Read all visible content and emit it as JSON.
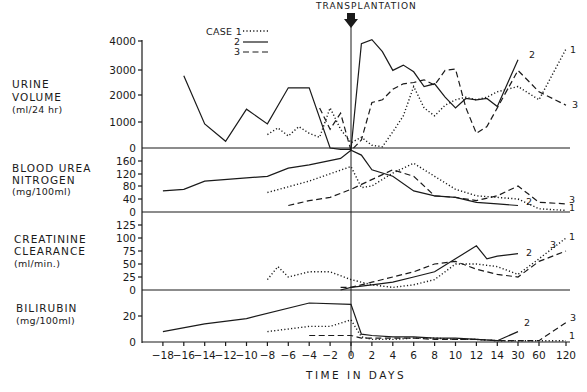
{
  "chart_data": {
    "type": "line",
    "title": "",
    "annotation": "TRANSPLANTATION",
    "xlabel": "TIME IN DAYS",
    "x_ticks": [
      "-18",
      "-16",
      "-14",
      "-12",
      "-10",
      "-8",
      "-6",
      "-4",
      "-2",
      "0",
      "2",
      "4",
      "6",
      "8",
      "10",
      "12",
      "14",
      "30",
      "60",
      "120"
    ],
    "legend": {
      "title": "CASE",
      "entries": [
        {
          "label": "1",
          "style": "dotted"
        },
        {
          "label": "2",
          "style": "solid"
        },
        {
          "label": "3",
          "style": "dashed"
        }
      ],
      "position": "top-center"
    },
    "panels": [
      {
        "name": "urine-volume",
        "ylabel": [
          "URINE",
          "VOLUME",
          "(ml/24 hr)"
        ],
        "y_ticks": [
          "0",
          "1000",
          "2000",
          "3000",
          "4000"
        ],
        "ylim": [
          0,
          4000
        ],
        "series": [
          {
            "name": "1",
            "x": [
              "-8",
              "-7",
              "-6",
              "-5",
              "-4",
              "-3",
              "-2",
              "-1",
              "0",
              "1",
              "2",
              "3",
              "4",
              "5",
              "6",
              "7",
              "8",
              "9",
              "10",
              "11",
              "12",
              "13",
              "14",
              "30",
              "60",
              "120"
            ],
            "values": [
              500,
              750,
              450,
              800,
              550,
              400,
              1500,
              700,
              200,
              400,
              100,
              50,
              600,
              1200,
              2300,
              1500,
              1200,
              1600,
              1800,
              1900,
              1800,
              1900,
              2100,
              2300,
              1800,
              3700
            ]
          },
          {
            "name": "2",
            "x": [
              "-16",
              "-14",
              "-12",
              "-10",
              "-8",
              "-6",
              "-4",
              "-2",
              "-1",
              "0",
              "1",
              "2",
              "3",
              "4",
              "5",
              "6",
              "7",
              "8",
              "9",
              "10",
              "11",
              "12",
              "13",
              "14",
              "30"
            ],
            "values": [
              2700,
              900,
              250,
              1450,
              900,
              2250,
              2250,
              0,
              -50,
              -50,
              3900,
              4050,
              3600,
              2900,
              3100,
              2850,
              2300,
              2400,
              1900,
              1500,
              1850,
              1800,
              1850,
              1550,
              3300
            ]
          },
          {
            "name": "3",
            "x": [
              "-3",
              "-2",
              "-1",
              "0",
              "1",
              "2",
              "3",
              "4",
              "5",
              "6",
              "7",
              "8",
              "9",
              "10",
              "11",
              "12",
              "13",
              "14",
              "30",
              "60",
              "120"
            ],
            "values": [
              1500,
              700,
              1300,
              -100,
              300,
              1700,
              1800,
              2200,
              2400,
              2450,
              2550,
              2350,
              2900,
              2950,
              1500,
              550,
              800,
              1500,
              2900,
              2100,
              1600
            ]
          }
        ]
      },
      {
        "name": "blood-urea-nitrogen",
        "ylabel": [
          "BLOOD UREA",
          "NITROGEN",
          "(mg/100ml)"
        ],
        "y_ticks": [
          "0",
          "40",
          "80",
          "120",
          "160"
        ],
        "ylim": [
          0,
          160
        ],
        "series": [
          {
            "name": "1",
            "x": [
              "-8",
              "-4",
              "0",
              "1",
              "2",
              "4",
              "6",
              "8",
              "10",
              "12",
              "14",
              "30",
              "60",
              "120"
            ],
            "values": [
              60,
              95,
              140,
              75,
              80,
              120,
              150,
              110,
              70,
              50,
              45,
              40,
              10,
              5
            ]
          },
          {
            "name": "2",
            "x": [
              "-18",
              "-16",
              "-14",
              "-10",
              "-8",
              "-6",
              "-4",
              "-1",
              "0",
              "1",
              "2",
              "4",
              "6",
              "8",
              "10",
              "12",
              "14",
              "30"
            ],
            "values": [
              65,
              70,
              95,
              105,
              110,
              135,
              145,
              165,
              190,
              175,
              130,
              110,
              65,
              50,
              45,
              30,
              25,
              20
            ]
          },
          {
            "name": "3",
            "x": [
              "-6",
              "-4",
              "-2",
              "0",
              "4",
              "6",
              "8",
              "10",
              "12",
              "14",
              "30",
              "60",
              "120"
            ],
            "values": [
              20,
              35,
              45,
              70,
              130,
              110,
              50,
              45,
              35,
              50,
              80,
              30,
              25
            ]
          }
        ]
      },
      {
        "name": "creatinine-clearance",
        "ylabel": [
          "CREATININE",
          "CLEARANCE",
          "(ml/min.)"
        ],
        "y_ticks": [
          "0",
          "25",
          "50",
          "75",
          "100",
          "125"
        ],
        "ylim": [
          0,
          125
        ],
        "series": [
          {
            "name": "1",
            "x": [
              "-8",
              "-7",
              "-6",
              "-4",
              "-2",
              "0",
              "2",
              "4",
              "6",
              "8",
              "10",
              "12",
              "14",
              "30",
              "60",
              "120"
            ],
            "values": [
              20,
              45,
              25,
              35,
              35,
              20,
              10,
              5,
              10,
              20,
              50,
              50,
              45,
              30,
              60,
              100
            ]
          },
          {
            "name": "2",
            "x": [
              "-1",
              "0",
              "2",
              "4",
              "6",
              "8",
              "10",
              "12",
              "13",
              "14",
              "30"
            ],
            "values": [
              0,
              5,
              10,
              15,
              25,
              35,
              60,
              85,
              60,
              65,
              70
            ]
          },
          {
            "name": "3",
            "x": [
              "-1",
              "0",
              "2",
              "4",
              "6",
              "8",
              "10",
              "12",
              "14",
              "30",
              "60",
              "120"
            ],
            "values": [
              5,
              5,
              15,
              25,
              35,
              50,
              55,
              40,
              30,
              25,
              55,
              75
            ]
          }
        ]
      },
      {
        "name": "bilirubin",
        "ylabel": [
          "BILIRUBIN",
          "(mg/100ml)"
        ],
        "y_ticks": [
          "0",
          "20"
        ],
        "ylim": [
          0,
          30
        ],
        "series": [
          {
            "name": "1",
            "x": [
              "-8",
              "-4",
              "-2",
              "0",
              "1",
              "2",
              "4",
              "6",
              "8",
              "10",
              "12",
              "14",
              "30",
              "60",
              "120"
            ],
            "values": [
              8,
              12,
              12,
              17,
              4,
              2,
              2,
              3,
              3,
              2,
              2,
              1,
              1,
              1,
              1
            ]
          },
          {
            "name": "2",
            "x": [
              "-18",
              "-14",
              "-10",
              "-4",
              "0",
              "1",
              "2",
              "4",
              "6",
              "8",
              "10",
              "12",
              "14",
              "30"
            ],
            "values": [
              8,
              14,
              18,
              30,
              29,
              6,
              5,
              4,
              4,
              3,
              3,
              2,
              1,
              8
            ]
          },
          {
            "name": "3",
            "x": [
              "-4",
              "0",
              "1",
              "2",
              "4",
              "6",
              "8",
              "10",
              "12",
              "14",
              "30",
              "60",
              "120"
            ],
            "values": [
              5,
              5,
              3,
              3,
              3,
              3,
              2,
              2,
              2,
              1,
              1,
              1,
              15
            ]
          }
        ]
      }
    ],
    "grid": false
  },
  "labels": {
    "transplantation": "TRANSPLANTATION",
    "legend_case": "CASE 1",
    "legend_2": "2",
    "legend_3": "3",
    "xlabel": "TIME IN DAYS",
    "urine_1": "URINE",
    "urine_2": "VOLUME",
    "urine_3": "(ml/24 hr)",
    "bun_1": "BLOOD UREA",
    "bun_2": "NITROGEN",
    "bun_3": "(mg/100ml)",
    "cc_1": "CREATININE",
    "cc_2": "CLEARANCE",
    "cc_3": "(ml/min.)",
    "bili_1": "BILIRUBIN",
    "bili_2": "(mg/100ml)",
    "end_label_1": "1",
    "end_label_2": "2",
    "end_label_3": "3"
  }
}
